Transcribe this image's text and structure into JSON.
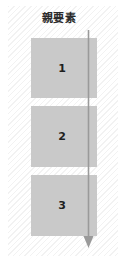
{
  "diagram": {
    "parent": {
      "label": "親要素"
    },
    "children": [
      {
        "label": "1"
      },
      {
        "label": "2"
      },
      {
        "label": "3"
      }
    ],
    "arrow": {
      "name": "flow-direction-arrow",
      "direction": "down",
      "color": "#9a9a9a"
    },
    "colors": {
      "child_box_fill": "#c9c9c9",
      "parent_hatch_light": "#ffffff",
      "parent_hatch_line": "#f2f2f2",
      "label_text": "#2b2b2b",
      "number_text": "#1f1f1f",
      "page_background": "#ffffff"
    }
  }
}
